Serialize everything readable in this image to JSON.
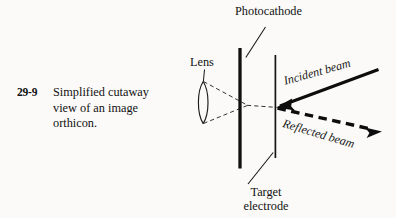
{
  "figure": {
    "caption_number": "29-9",
    "caption_text": "Simplified cutaway view of an image orthicon.",
    "background_color": "#fbfaf8",
    "ink_color": "#121212"
  },
  "labels": {
    "photocathode": "Photocathode",
    "lens": "Lens",
    "target_electrode_line1": "Target",
    "target_electrode_line2": "electrode",
    "incident_beam": "Incident beam",
    "reflected_beam": "Reflected beam"
  },
  "diagram": {
    "type": "optical-schematic",
    "components": [
      {
        "name": "lens",
        "shape": "biconvex-lens",
        "center_x": 203,
        "top_y": 81,
        "bottom_y": 124
      },
      {
        "name": "photocathode",
        "shape": "thick-vertical-plate",
        "x": 240,
        "top_y": 48,
        "bottom_y": 168,
        "stroke_width": 3.2
      },
      {
        "name": "target-electrode",
        "shape": "thin-vertical-plate",
        "x": 275,
        "top_y": 55,
        "bottom_y": 158,
        "stroke_width": 1.6
      },
      {
        "name": "light-cone",
        "shape": "dashed-converging-rays",
        "focus_x": 247,
        "focus_y": 105,
        "extends_to_x": 276
      },
      {
        "name": "incident-beam",
        "shape": "solid-arrow",
        "from": [
          378,
          70
        ],
        "to": [
          277,
          107
        ],
        "direction": "leftward",
        "stroke_width": 3.0
      },
      {
        "name": "reflected-beam",
        "shape": "dashed-arrow",
        "from": [
          277,
          108
        ],
        "to": [
          381,
          131
        ],
        "direction": "rightward",
        "stroke_width": 3.4
      }
    ],
    "leader_lines": [
      {
        "name": "photocathode-leader",
        "from": [
          265,
          27
        ],
        "to": [
          246,
          57
        ]
      },
      {
        "name": "lens-leader",
        "from": [
          204,
          70
        ],
        "to": [
          203,
          82
        ]
      },
      {
        "name": "target-leader",
        "from": [
          248,
          184
        ],
        "to": [
          273,
          153
        ]
      }
    ]
  }
}
